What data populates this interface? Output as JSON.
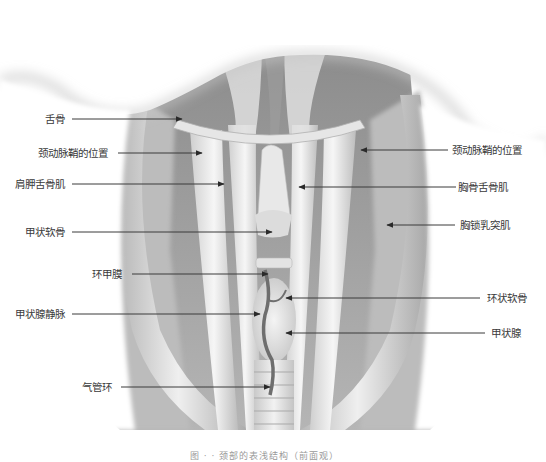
{
  "figure": {
    "caption": "图 · · 颈部的表浅结构（前面观）",
    "colors": {
      "background": "#ffffff",
      "muscle_light": "#e9e9e9",
      "muscle_mid": "#c4c4c4",
      "muscle_dark": "#8c8c8c",
      "leader_line": "#3a3a3a",
      "label_text": "#3a3a3a",
      "vein": "#6e6e6e"
    }
  },
  "labels_left": [
    {
      "text": "舌骨",
      "x": 45,
      "y": 113
    },
    {
      "text": "颈动脉鞘的位置",
      "x": 38,
      "y": 147
    },
    {
      "text": "肩胛舌骨肌",
      "x": 15,
      "y": 178
    },
    {
      "text": "甲状软骨",
      "x": 25,
      "y": 226
    },
    {
      "text": "环甲膜",
      "x": 92,
      "y": 268
    },
    {
      "text": "甲状腺静脉",
      "x": 15,
      "y": 308
    },
    {
      "text": "气管环",
      "x": 82,
      "y": 381
    }
  ],
  "labels_right": [
    {
      "text": "颈动脉鞘的位置",
      "x": 452,
      "y": 144
    },
    {
      "text": "胸骨舌骨肌",
      "x": 458,
      "y": 181
    },
    {
      "text": "胸锁乳突肌",
      "x": 460,
      "y": 219
    },
    {
      "text": "环状软骨",
      "x": 487,
      "y": 292
    },
    {
      "text": "甲状腺",
      "x": 491,
      "y": 327
    }
  ],
  "leaders": [
    {
      "name": "hyoid",
      "x1": 72,
      "y1": 119,
      "x2": 182,
      "y2": 119
    },
    {
      "name": "carotid-sheath-left",
      "x1": 118,
      "y1": 153,
      "x2": 202,
      "y2": 153
    },
    {
      "name": "omohyoid",
      "x1": 72,
      "y1": 184,
      "x2": 224,
      "y2": 184
    },
    {
      "name": "thyroid-cartilage",
      "x1": 72,
      "y1": 232,
      "x2": 272,
      "y2": 232
    },
    {
      "name": "cricothyroid-membrane",
      "x1": 132,
      "y1": 274,
      "x2": 268,
      "y2": 274
    },
    {
      "name": "thyroid-vein",
      "x1": 72,
      "y1": 314,
      "x2": 260,
      "y2": 314
    },
    {
      "name": "tracheal-ring",
      "x1": 121,
      "y1": 387,
      "x2": 270,
      "y2": 387
    },
    {
      "name": "carotid-sheath-right",
      "x1": 448,
      "y1": 150,
      "x2": 361,
      "y2": 150
    },
    {
      "name": "sternohyoid",
      "x1": 456,
      "y1": 187,
      "x2": 299,
      "y2": 187
    },
    {
      "name": "sternocleidomastoid",
      "x1": 455,
      "y1": 225,
      "x2": 387,
      "y2": 225
    },
    {
      "name": "cricoid-cartilage",
      "x1": 480,
      "y1": 298,
      "x2": 286,
      "y2": 298
    },
    {
      "name": "thyroid-gland",
      "x1": 485,
      "y1": 333,
      "x2": 286,
      "y2": 333
    }
  ]
}
